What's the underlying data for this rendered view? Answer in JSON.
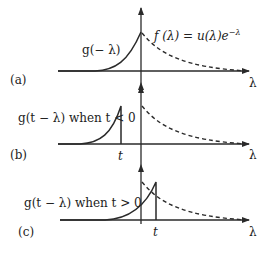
{
  "panels": [
    {
      "id": "a",
      "panel_label": "(a)",
      "axis_label": "λ",
      "solid_curve_label": "g(− λ)",
      "dashed_curve_label": "f (λ) = u(λ)e",
      "dashed_curve_exponent": "−λ"
    },
    {
      "id": "b",
      "panel_label": "(b)",
      "axis_label": "λ",
      "solid_curve_label": "g(t − λ) when t < 0",
      "tick_label": "t"
    },
    {
      "id": "c",
      "panel_label": "(c)",
      "axis_label": "λ",
      "solid_curve_label": "g(t − λ) when t > 0",
      "tick_label": "t"
    }
  ],
  "colors": {
    "stroke": "#2a2a2a",
    "text": "#222222"
  }
}
